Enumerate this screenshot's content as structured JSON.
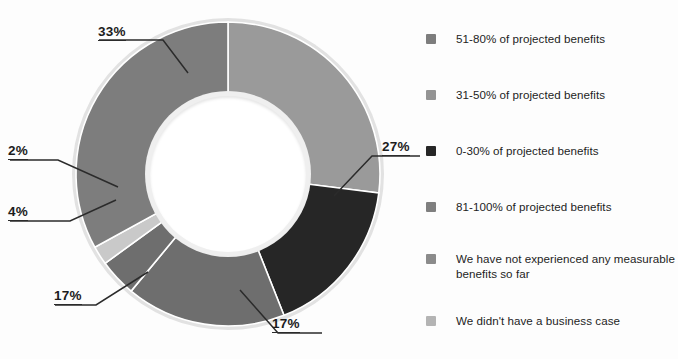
{
  "chart_data": {
    "type": "pie",
    "variant": "donut",
    "title": "",
    "xlabel": "",
    "ylabel": "",
    "units": "percent",
    "legend_position": "right",
    "grid": false,
    "start_angle_deg": 0,
    "direction": "clockwise",
    "categories": [
      "81-100% of projected benefits",
      "0-30% of projected benefits",
      "31-50% of projected benefits",
      "We have not experienced any measurable benefits so far",
      "We didn't have a business case",
      "51-80% of projected benefits"
    ],
    "values": [
      27,
      17,
      17,
      4,
      2,
      33
    ],
    "data_labels": [
      "27%",
      "17%",
      "17%",
      "4%",
      "2%",
      "33%"
    ],
    "colors": [
      "#9a9a9a",
      "#262626",
      "#6e6e6e",
      "#6e6e6e",
      "#c9c9c9",
      "#7d7d7d"
    ],
    "slices": [
      {
        "label": "27%",
        "value": 27,
        "category": "81-100% of projected benefits",
        "color": "#9a9a9a"
      },
      {
        "label": "17%",
        "value": 17,
        "category": "0-30% of projected benefits",
        "color": "#262626"
      },
      {
        "label": "17%",
        "value": 17,
        "category": "31-50% of projected benefits",
        "color": "#6e6e6e"
      },
      {
        "label": "4%",
        "value": 4,
        "category": "We have not experienced any measurable benefits so far",
        "color": "#6e6e6e"
      },
      {
        "label": "2%",
        "value": 2,
        "category": "We didn't have a business case",
        "color": "#c9c9c9"
      },
      {
        "label": "33%",
        "value": 33,
        "category": "51-80% of projected benefits",
        "color": "#7d7d7d"
      }
    ]
  },
  "callouts": {
    "pct_33": "33%",
    "pct_27": "27%",
    "pct_2": "2%",
    "pct_4": "4%",
    "pct_17_left": "17%",
    "pct_17_bottom": "17%"
  },
  "legend": {
    "items": [
      {
        "label": "51-80% of projected benefits",
        "color": "#7d7d7d"
      },
      {
        "label": "31-50% of projected benefits",
        "color": "#949494"
      },
      {
        "label": "0-30% of projected benefits",
        "color": "#262626"
      },
      {
        "label": "81-100% of projected benefits",
        "color": "#7f7f7f"
      },
      {
        "label": "We have not experienced any measurable benefits so far",
        "color": "#8b8b8b"
      },
      {
        "label": "We didn't have a business case",
        "color": "#b4b4b4"
      }
    ]
  },
  "colors": {
    "background": "#fdfdfd",
    "text": "#1d1d1d",
    "leader_line": "#2b2b2b",
    "donut_rim": "#e2e2e2",
    "donut_hole": "#ffffff"
  }
}
